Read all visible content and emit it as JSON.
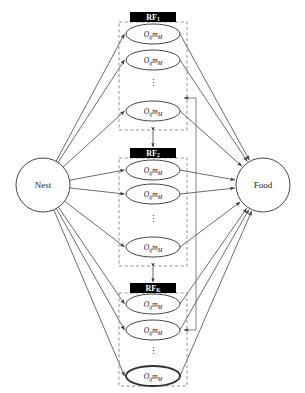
{
  "diagram": {
    "background_color": "#ffffff",
    "line_color": "#3c3c3c",
    "dashed_box_color": "#7a7a7a",
    "header_bar_color": "#000000",
    "header_text_color": "#ffffff",
    "node_fill": "#ffffff",
    "node_stroke": "#333333"
  },
  "endpoints": {
    "source": {
      "label": "Nest",
      "cx": 43,
      "cy": 185,
      "r": 27
    },
    "target": {
      "label": "Food",
      "cx": 263,
      "cy": 185,
      "r": 27
    }
  },
  "groups": [
    {
      "id": "rf1",
      "header_label": "RF",
      "header_sub": "1",
      "header_x": 130,
      "header_y": 12,
      "header_w": 46,
      "header_h": 10,
      "box_x": 119,
      "box_y": 22,
      "box_w": 68,
      "box_h": 108,
      "nodes": [
        {
          "label": "O",
          "sub1": "ij",
          "mid": "m",
          "sub2": "M",
          "cx": 153,
          "cy": 34,
          "rx": 27,
          "ry": 10,
          "emphasis": "normal"
        },
        {
          "label": "O",
          "sub1": "ij",
          "mid": "m",
          "sub2": "M",
          "cx": 153,
          "cy": 60,
          "rx": 27,
          "ry": 10,
          "emphasis": "normal"
        },
        {
          "label": "O",
          "sub1": "ij",
          "mid": "m",
          "sub2": "M",
          "cx": 153,
          "cy": 111,
          "rx": 27,
          "ry": 10,
          "emphasis": "normal"
        }
      ],
      "ellipsis_x": 153,
      "ellipsis_y": 86
    },
    {
      "id": "rf2",
      "header_label": "RF",
      "header_sub": "2",
      "header_x": 130,
      "header_y": 148,
      "header_w": 46,
      "header_h": 10,
      "box_x": 119,
      "box_y": 158,
      "box_w": 68,
      "box_h": 108,
      "nodes": [
        {
          "label": "O",
          "sub1": "ij",
          "mid": "m",
          "sub2": "M",
          "cx": 153,
          "cy": 170,
          "rx": 27,
          "ry": 10,
          "emphasis": "normal"
        },
        {
          "label": "O",
          "sub1": "ij",
          "mid": "m",
          "sub2": "M",
          "cx": 153,
          "cy": 194,
          "rx": 27,
          "ry": 10,
          "emphasis": "normal"
        },
        {
          "label": "O",
          "sub1": "ij",
          "mid": "m",
          "sub2": "M",
          "cx": 153,
          "cy": 247,
          "rx": 27,
          "ry": 10,
          "emphasis": "normal"
        }
      ],
      "ellipsis_x": 153,
      "ellipsis_y": 222
    },
    {
      "id": "rfk",
      "header_label": "RF",
      "header_sub": "K",
      "header_x": 130,
      "header_y": 283,
      "header_w": 46,
      "header_h": 10,
      "box_x": 119,
      "box_y": 293,
      "box_w": 68,
      "box_h": 93,
      "nodes": [
        {
          "label": "O",
          "sub1": "ij",
          "mid": "m",
          "sub2": "M",
          "cx": 153,
          "cy": 304,
          "rx": 27,
          "ry": 10,
          "emphasis": "normal"
        },
        {
          "label": "O",
          "sub1": "ij",
          "mid": "m",
          "sub2": "M",
          "cx": 153,
          "cy": 330,
          "rx": 27,
          "ry": 10,
          "emphasis": "normal"
        },
        {
          "label": "O",
          "sub1": "ij",
          "mid": "m",
          "sub2": "M",
          "cx": 153,
          "cy": 376,
          "rx": 27,
          "ry": 10,
          "emphasis": "bold"
        }
      ],
      "ellipsis_x": 153,
      "ellipsis_y": 354
    }
  ],
  "inter_group_links": [
    {
      "from_group": "rf1",
      "to_group": "rf2",
      "x": 153,
      "y1": 131,
      "y2": 147,
      "style": "double-arrow"
    },
    {
      "from_group": "rf2",
      "to_group": "rfk",
      "x": 153,
      "y1": 267,
      "y2": 282,
      "style": "double-arrow"
    }
  ],
  "feedback_lines": [
    {
      "id": "feedback-upper",
      "x": 196,
      "y_top": 98,
      "y_bottom": 193,
      "arrow_at": "top-left"
    },
    {
      "id": "feedback-lower",
      "x": 196,
      "y_top": 193,
      "y_bottom": 330,
      "arrow_at": "bottom-left"
    }
  ]
}
